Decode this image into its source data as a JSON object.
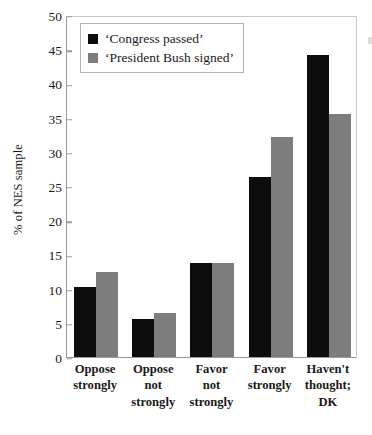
{
  "chart_data": {
    "type": "bar",
    "title": "",
    "xlabel": "",
    "ylabel": "% of NES sample",
    "ylim": [
      0,
      50
    ],
    "ytick_step": 5,
    "yticks": [
      0,
      5,
      10,
      15,
      20,
      25,
      30,
      35,
      40,
      45,
      50
    ],
    "ytick_labels": [
      "0",
      "5",
      "10",
      "15",
      "20",
      "25",
      "30",
      "35",
      "40",
      "45",
      "50"
    ],
    "grid": false,
    "legend_position": "upper left",
    "categories": [
      "Oppose strongly",
      "Oppose not strongly",
      "Favor not strongly",
      "Favor strongly",
      "Haven't thought; DK"
    ],
    "category_lines": [
      [
        "Oppose",
        "strongly"
      ],
      [
        "Oppose",
        "not",
        "strongly"
      ],
      [
        "Favor",
        "not",
        "strongly"
      ],
      [
        "Favor",
        "strongly"
      ],
      [
        "Haven't",
        "thought;",
        "DK"
      ]
    ],
    "series": [
      {
        "name": "‘Congress passed’",
        "color": "#0d0d0d",
        "values": [
          10.2,
          5.5,
          13.8,
          26.3,
          44.1
        ]
      },
      {
        "name": "‘President Bush signed’",
        "color": "#7d7d7d",
        "values": [
          12.5,
          6.4,
          13.8,
          32.1,
          35.5
        ]
      }
    ]
  },
  "axis": {
    "y_title": "% of NES sample"
  }
}
